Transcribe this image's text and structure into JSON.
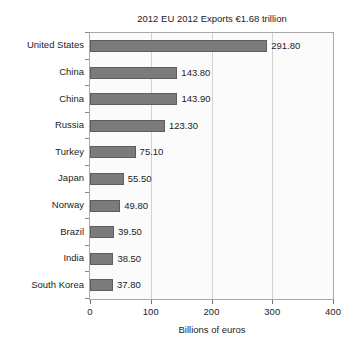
{
  "chart_data": {
    "type": "bar",
    "orientation": "horizontal",
    "title": "2012 EU 2012 Exports €1.68 trillion",
    "xlabel": "Billions of euros",
    "ylabel": "",
    "xlim": [
      0,
      400
    ],
    "xticks": [
      0,
      100,
      200,
      300,
      400
    ],
    "xtick_labels": [
      "0",
      "100",
      "200",
      "300",
      "400"
    ],
    "grid": true,
    "grid_axis": "x",
    "legend": false,
    "categories": [
      "United States",
      "China",
      "China",
      "Russia",
      "Turkey",
      "Japan",
      "Norway",
      "Brazil",
      "India",
      "South Korea"
    ],
    "values": [
      291.8,
      143.8,
      143.9,
      123.3,
      75.1,
      55.5,
      49.8,
      39.5,
      38.5,
      37.8
    ],
    "value_labels": [
      "291.80",
      "143.80",
      "143.90",
      "123.30",
      "75.10",
      "55.50",
      "49.80",
      "39.50",
      "38.50",
      "37.80"
    ],
    "bar_color": "#7b7b7b",
    "bar_edge_color": "#5e5e5e",
    "plot_background": "#fbfbfb",
    "grid_color": "#d2d2d2",
    "axis_color": "#a8a8a8",
    "text_color": "#1c1c1c"
  }
}
